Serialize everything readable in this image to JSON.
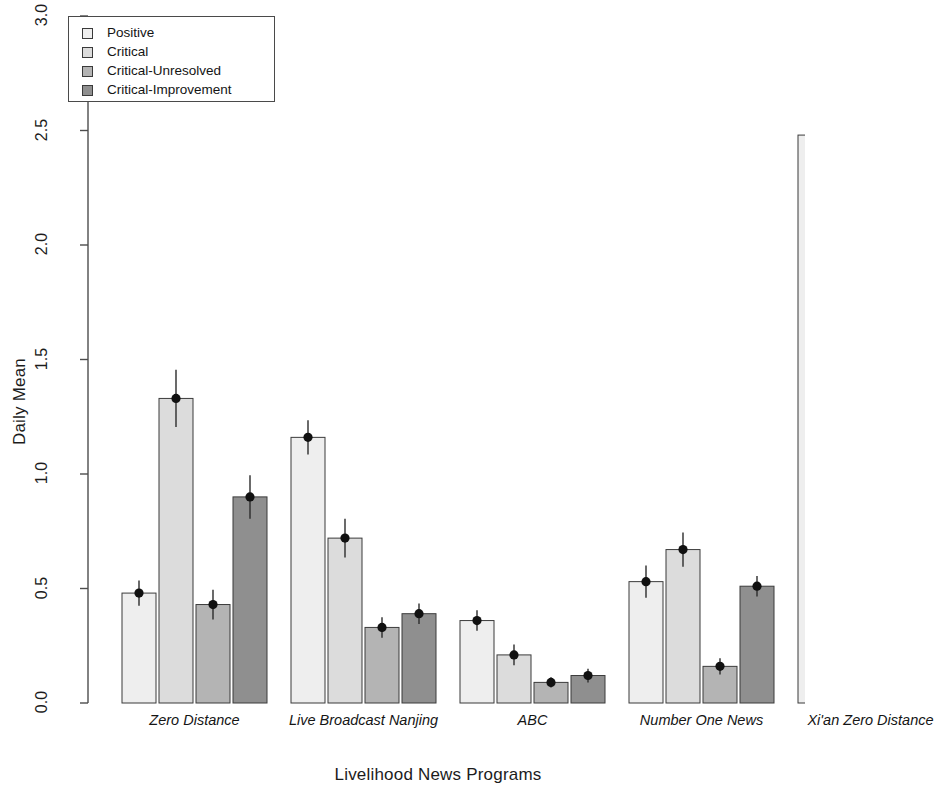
{
  "chart_data": {
    "type": "bar",
    "title": "",
    "xlabel": "Livelihood News Programs",
    "ylabel": "Daily Mean",
    "ylim": [
      0.0,
      3.0
    ],
    "ytick_labels": [
      "0.0",
      "0.5",
      "1.0",
      "1.5",
      "2.0",
      "2.5",
      "3.0"
    ],
    "ytick_values": [
      0.0,
      0.5,
      1.0,
      1.5,
      2.0,
      2.5,
      3.0
    ],
    "grid": false,
    "legend_position": "top-left",
    "categories": [
      "Zero Distance",
      "Live Broadcast Nanjing",
      "ABC",
      "Number One News",
      "Xi'an Zero Distance"
    ],
    "series": [
      {
        "name": "Positive",
        "color": "#eeeeee",
        "values": [
          0.48,
          1.16,
          0.36,
          0.53,
          2.48
        ],
        "errors": [
          0.055,
          0.075,
          0.045,
          0.07,
          0.205
        ]
      },
      {
        "name": "Critical",
        "color": "#dcdcdc",
        "values": [
          1.33,
          0.72,
          0.21,
          0.67,
          2.63
        ],
        "errors": [
          0.125,
          0.085,
          0.045,
          0.075,
          0.19
        ]
      },
      {
        "name": "Critical-Unresolved",
        "color": "#b4b4b4",
        "values": [
          0.43,
          0.33,
          0.09,
          0.16,
          1.43
        ],
        "errors": [
          0.065,
          0.045,
          0.022,
          0.035,
          0.115
        ]
      },
      {
        "name": "Critical-Improvement",
        "color": "#8f8f8f",
        "values": [
          0.9,
          0.39,
          0.12,
          0.51,
          1.19
        ],
        "errors": [
          0.095,
          0.045,
          0.03,
          0.045,
          0.1
        ]
      }
    ]
  },
  "legend": {
    "items": [
      {
        "label": "Positive"
      },
      {
        "label": "Critical"
      },
      {
        "label": "Critical-Unresolved"
      },
      {
        "label": "Critical-Improvement"
      }
    ]
  },
  "axes": {
    "y_title": "Daily Mean",
    "x_title": "Livelihood News Programs"
  }
}
